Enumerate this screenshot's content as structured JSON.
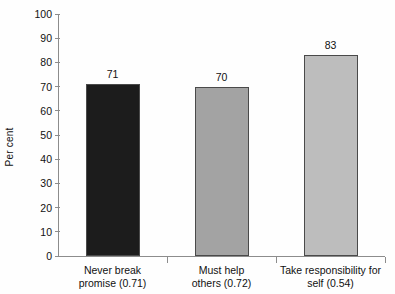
{
  "chart_data": {
    "type": "bar",
    "title": "",
    "xlabel": "",
    "ylabel": "Per cent",
    "ylim": [
      0,
      100
    ],
    "ytick_values": [
      0,
      10,
      20,
      30,
      40,
      50,
      60,
      70,
      80,
      90,
      100
    ],
    "ytick_labels": [
      "0",
      "10",
      "20",
      "30",
      "40",
      "50",
      "60",
      "70",
      "80",
      "90",
      "100"
    ],
    "grid": false,
    "legend": "none",
    "categories": [
      "Never break promise (0.71)",
      "Must help others (0.72)",
      "Take responsibility for self (0.54)"
    ],
    "category_lines": [
      [
        "Never break",
        "promise (0.71)"
      ],
      [
        "Must help",
        "others (0.72)"
      ],
      [
        "Take responsibility for",
        "self (0.54)"
      ]
    ],
    "values": [
      71,
      70,
      83
    ],
    "value_labels": [
      "71",
      "70",
      "83"
    ],
    "bar_colors": [
      "#1c1c1c",
      "#a3a3a3",
      "#bdbdbd"
    ],
    "bar_edge_color": "#4a4a4a",
    "axis_color": "#8c8c8c",
    "background": "#fefefe"
  }
}
